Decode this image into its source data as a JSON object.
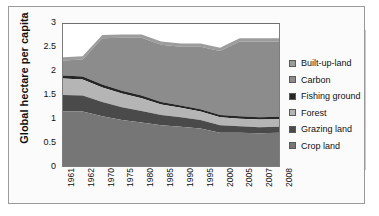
{
  "chart_data": {
    "type": "area",
    "title": "",
    "subtitle": "",
    "xlabel": "",
    "ylabel": "Global hectare per capita",
    "ylim": [
      0,
      3
    ],
    "yticks": [
      "3",
      "2.5",
      "2",
      "1.5",
      "1",
      "0.5",
      "0"
    ],
    "ytick_values": [
      3,
      2.5,
      2,
      1.5,
      1,
      0.5,
      0
    ],
    "grid": false,
    "stacked": true,
    "legend_position": "right",
    "categories": [
      "1961",
      "1962",
      "1970",
      "1975",
      "1980",
      "1985",
      "1990",
      "1995",
      "2000",
      "2005",
      "2007",
      "2008"
    ],
    "series": [
      {
        "name": "Crop land",
        "color": "#767676",
        "values": [
          1.15,
          1.15,
          1.05,
          0.97,
          0.92,
          0.86,
          0.83,
          0.79,
          0.7,
          0.7,
          0.69,
          0.7
        ]
      },
      {
        "name": "Grazing land",
        "color": "#4a4a4a",
        "values": [
          0.35,
          0.34,
          0.3,
          0.27,
          0.24,
          0.22,
          0.2,
          0.18,
          0.16,
          0.14,
          0.13,
          0.13
        ]
      },
      {
        "name": "Forest",
        "color": "#b5b5b5",
        "values": [
          0.35,
          0.34,
          0.31,
          0.29,
          0.27,
          0.22,
          0.2,
          0.18,
          0.17,
          0.16,
          0.16,
          0.16
        ]
      },
      {
        "name": "Fishing ground",
        "color": "#262626",
        "values": [
          0.06,
          0.06,
          0.06,
          0.06,
          0.06,
          0.05,
          0.05,
          0.05,
          0.05,
          0.05,
          0.05,
          0.05
        ]
      },
      {
        "name": "Carbon",
        "color": "#8c8c8c",
        "values": [
          0.32,
          0.36,
          0.98,
          1.12,
          1.22,
          1.21,
          1.24,
          1.32,
          1.35,
          1.58,
          1.6,
          1.59
        ]
      },
      {
        "name": "Built-up-land",
        "color": "#9c9c9c",
        "values": [
          0.07,
          0.07,
          0.07,
          0.07,
          0.07,
          0.07,
          0.07,
          0.07,
          0.07,
          0.07,
          0.07,
          0.07
        ]
      }
    ],
    "stack_totals": [
      2.3,
      2.32,
      2.77,
      2.78,
      2.78,
      2.63,
      2.59,
      2.59,
      2.5,
      2.7,
      2.7,
      2.7
    ],
    "legend": [
      {
        "label": "Built-up-land",
        "color": "#9c9c9c"
      },
      {
        "label": "Carbon",
        "color": "#8c8c8c"
      },
      {
        "label": "Fishing ground",
        "color": "#262626"
      },
      {
        "label": "Forest",
        "color": "#b5b5b5"
      },
      {
        "label": "Grazing land",
        "color": "#4a4a4a"
      },
      {
        "label": "Crop land",
        "color": "#767676"
      }
    ]
  }
}
